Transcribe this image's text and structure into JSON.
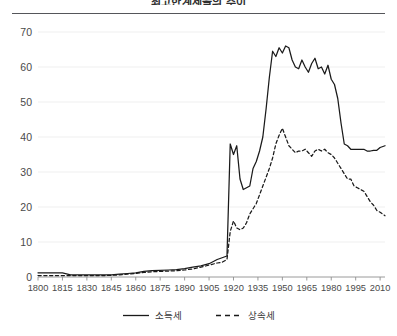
{
  "chart": {
    "title": "최고한계세율의 추이",
    "axes": {
      "y_ticks": [
        "0",
        "10",
        "20",
        "30",
        "40",
        "50",
        "60",
        "70"
      ],
      "x_ticks": [
        "1800",
        "1815",
        "1830",
        "1845",
        "1860",
        "1875",
        "1890",
        "1905",
        "1920",
        "1935",
        "1950",
        "1965",
        "1980",
        "1995",
        "2010"
      ]
    },
    "legend": {
      "position": "bottom-center",
      "entries": [
        {
          "label": "소득세",
          "style": "solid",
          "color": "#1a1a1a",
          "icon": "solid-line-swatch"
        },
        {
          "label": "상속세",
          "style": "dashed",
          "color": "#1a1a1a",
          "icon": "dashed-line-swatch"
        }
      ]
    }
  },
  "chart_data": {
    "type": "line",
    "title": "최고한계세율의 추이",
    "xlabel": "",
    "ylabel": "",
    "xlim": [
      1800,
      2013
    ],
    "ylim": [
      0,
      70
    ],
    "grid": true,
    "legend_position": "bottom-center",
    "categories": [
      1800,
      1805,
      1810,
      1815,
      1820,
      1825,
      1830,
      1835,
      1840,
      1845,
      1850,
      1855,
      1860,
      1865,
      1870,
      1875,
      1880,
      1885,
      1890,
      1895,
      1900,
      1905,
      1910,
      1913,
      1916,
      1918,
      1920,
      1922,
      1924,
      1926,
      1928,
      1930,
      1932,
      1934,
      1936,
      1938,
      1940,
      1942,
      1944,
      1946,
      1948,
      1950,
      1952,
      1954,
      1956,
      1958,
      1960,
      1962,
      1964,
      1966,
      1968,
      1970,
      1972,
      1974,
      1976,
      1978,
      1980,
      1982,
      1984,
      1986,
      1988,
      1990,
      1992,
      1994,
      1996,
      1998,
      2000,
      2002,
      2004,
      2006,
      2008,
      2010,
      2013
    ],
    "series": [
      {
        "name": "소득세",
        "style": "solid",
        "color": "#1a1a1a",
        "values": [
          1.2,
          1.2,
          1.2,
          1.2,
          0.6,
          0.6,
          0.6,
          0.6,
          0.6,
          0.6,
          0.8,
          1.0,
          1.2,
          1.6,
          1.8,
          1.9,
          2.0,
          2.1,
          2.4,
          2.8,
          3.2,
          3.8,
          5.0,
          5.5,
          6.0,
          38.0,
          35.0,
          37.5,
          28.0,
          25.0,
          25.5,
          26.0,
          31.0,
          33.0,
          36.0,
          40.0,
          48.0,
          57.0,
          64.5,
          63.0,
          65.5,
          64.0,
          66.0,
          65.5,
          62.0,
          60.0,
          59.5,
          62.0,
          60.0,
          58.5,
          61.0,
          62.5,
          59.5,
          60.0,
          58.0,
          60.5,
          56.5,
          55.0,
          51.0,
          44.0,
          38.0,
          37.5,
          36.5,
          36.5,
          36.5,
          36.5,
          36.5,
          36.0,
          36.0,
          36.2,
          36.2,
          37.0,
          37.5
        ]
      },
      {
        "name": "상속세",
        "style": "dashed",
        "color": "#1a1a1a",
        "values": [
          0.4,
          0.4,
          0.4,
          0.4,
          0.4,
          0.4,
          0.4,
          0.4,
          0.4,
          0.5,
          0.6,
          0.8,
          1.0,
          1.3,
          1.5,
          1.6,
          1.7,
          1.8,
          2.0,
          2.3,
          2.8,
          3.4,
          4.0,
          4.2,
          5.0,
          13.0,
          16.0,
          14.0,
          13.5,
          14.0,
          15.5,
          18.0,
          19.5,
          21.0,
          23.5,
          26.0,
          28.5,
          31.0,
          34.0,
          38.0,
          40.5,
          42.5,
          40.0,
          37.5,
          36.5,
          35.5,
          36.0,
          36.0,
          36.5,
          35.5,
          34.5,
          36.0,
          36.5,
          36.0,
          36.5,
          35.5,
          35.0,
          34.0,
          32.5,
          31.0,
          29.5,
          28.0,
          28.0,
          26.0,
          25.5,
          25.0,
          24.5,
          23.0,
          21.5,
          20.5,
          19.0,
          18.5,
          17.5
        ]
      }
    ]
  }
}
